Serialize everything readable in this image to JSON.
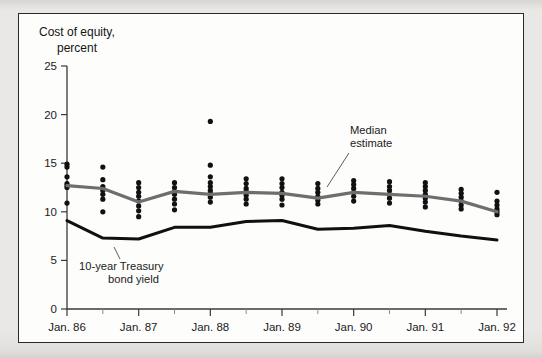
{
  "figure": {
    "title_line1": "Cost of equity,",
    "title_line2": "percent",
    "frame_color": "#2a2a2a",
    "page_background": "#e9e8e6",
    "plot_background": "#fdfdfc"
  },
  "annotations": {
    "median": {
      "line1": "Median",
      "line2": "estimate"
    },
    "treasury": {
      "line1": "10-year Treasury",
      "line2": "bond yield"
    }
  },
  "chart_data": {
    "type": "scatter",
    "title": "Cost of equity, percent",
    "xlabel": "",
    "ylabel": "percent",
    "ylim": [
      0,
      25
    ],
    "yticks": [
      0,
      5,
      10,
      15,
      20,
      25
    ],
    "ytick_labels": [
      "0",
      "5",
      "10",
      "15",
      "20",
      "25"
    ],
    "grid": false,
    "legend_position": "inline-annotations",
    "x": [
      "Jan. 86",
      "Jul. 86",
      "Jan. 87",
      "Jul. 87",
      "Jan. 88",
      "Jul. 88",
      "Jan. 89",
      "Jul. 89",
      "Jan. 90",
      "Jul. 90",
      "Jan. 91",
      "Jul. 91",
      "Jan. 92"
    ],
    "xtick_labels": [
      "Jan. 86",
      "Jan. 87",
      "Jan. 88",
      "Jan. 89",
      "Jan. 90",
      "Jan. 91",
      "Jan. 92"
    ],
    "xtick_minor_labels": [
      "Jul. 86",
      "Jul. 87",
      "Jul. 88",
      "Jul. 89",
      "Jul. 90",
      "Jul. 91"
    ],
    "series": [
      {
        "name": "Median estimate",
        "type": "line",
        "color": "#6e6e6e",
        "values": [
          12.7,
          12.4,
          11.0,
          12.1,
          11.8,
          12.0,
          11.9,
          11.4,
          12.0,
          11.8,
          11.6,
          11.1,
          10.0
        ]
      },
      {
        "name": "10-year Treasury bond yield",
        "type": "line",
        "color": "#101010",
        "values": [
          9.1,
          7.3,
          7.2,
          8.4,
          8.4,
          9.0,
          9.1,
          8.2,
          8.3,
          8.6,
          8.0,
          7.5,
          7.1
        ]
      },
      {
        "name": "Survey responses",
        "type": "scatter",
        "color": "#111111",
        "points": [
          {
            "x": "Jan. 86",
            "values": [
              14.9,
              14.6,
              13.6,
              12.9,
              12.7,
              12.5,
              10.9
            ]
          },
          {
            "x": "Jul. 86",
            "values": [
              14.6,
              13.3,
              12.6,
              12.2,
              11.8,
              11.3,
              10.0
            ]
          },
          {
            "x": "Jan. 87",
            "values": [
              13.0,
              12.5,
              12.0,
              11.6,
              11.1,
              10.6,
              10.1,
              9.5
            ]
          },
          {
            "x": "Jul. 87",
            "values": [
              13.0,
              12.5,
              12.1,
              11.8,
              11.3,
              10.8,
              10.2
            ]
          },
          {
            "x": "Jan. 88",
            "values": [
              19.3,
              14.8,
              13.6,
              13.0,
              12.6,
              12.2,
              11.9,
              11.5,
              11.0
            ]
          },
          {
            "x": "Jul. 88",
            "values": [
              13.4,
              12.9,
              12.4,
              12.1,
              11.7,
              11.3,
              10.8
            ]
          },
          {
            "x": "Jan. 89",
            "values": [
              13.4,
              12.9,
              12.5,
              12.0,
              11.7,
              11.3,
              10.7
            ]
          },
          {
            "x": "Jul. 89",
            "values": [
              12.9,
              12.4,
              12.0,
              11.6,
              11.2,
              10.8
            ]
          },
          {
            "x": "Jan. 90",
            "values": [
              13.2,
              12.8,
              12.4,
              12.0,
              11.6,
              11.1
            ]
          },
          {
            "x": "Jul. 90",
            "values": [
              13.1,
              12.6,
              12.2,
              11.8,
              11.4,
              10.9
            ]
          },
          {
            "x": "Jan. 91",
            "values": [
              13.0,
              12.6,
              12.2,
              11.8,
              11.4,
              11.0,
              10.5
            ]
          },
          {
            "x": "Jul. 91",
            "values": [
              12.3,
              11.9,
              11.5,
              11.1,
              10.7,
              10.3
            ]
          },
          {
            "x": "Jan. 92",
            "values": [
              12.0,
              11.1,
              10.7,
              10.3,
              10.0,
              9.7
            ]
          }
        ]
      }
    ]
  }
}
